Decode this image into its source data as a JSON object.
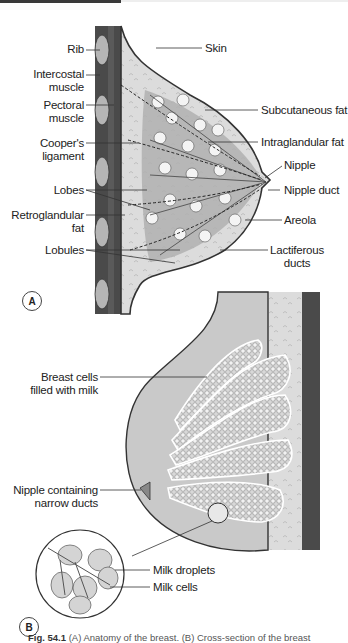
{
  "figure": {
    "panel_a": {
      "badge": "A",
      "left_labels": [
        {
          "text": "Rib",
          "lines": [
            "Rib"
          ]
        },
        {
          "text": "Intercostal muscle",
          "lines": [
            "Intercostal",
            "muscle"
          ]
        },
        {
          "text": "Pectoral muscle",
          "lines": [
            "Pectoral",
            "muscle"
          ]
        },
        {
          "text": "Cooper's ligament",
          "lines": [
            "Cooper's",
            "ligament"
          ]
        },
        {
          "text": "Lobes",
          "lines": [
            "Lobes"
          ]
        },
        {
          "text": "Retroglandular fat",
          "lines": [
            "Retroglandular",
            "fat"
          ]
        },
        {
          "text": "Lobules",
          "lines": [
            "Lobules"
          ]
        }
      ],
      "right_labels": [
        {
          "text": "Skin",
          "lines": [
            "Skin"
          ]
        },
        {
          "text": "Subcutaneous fat",
          "lines": [
            "Subcutaneous fat"
          ]
        },
        {
          "text": "Intraglandular fat",
          "lines": [
            "Intraglandular fat"
          ]
        },
        {
          "text": "Nipple",
          "lines": [
            "Nipple"
          ]
        },
        {
          "text": "Nipple duct",
          "lines": [
            "Nipple duct"
          ]
        },
        {
          "text": "Areola",
          "lines": [
            "Areola"
          ]
        },
        {
          "text": "Lactiferous ducts",
          "lines": [
            "Lactiferous",
            "ducts"
          ]
        }
      ]
    },
    "panel_b": {
      "badge": "B",
      "labels": [
        {
          "text": "Breast cells filled with milk",
          "lines": [
            "Breast cells",
            "filled with milk"
          ]
        },
        {
          "text": "Nipple containing narrow ducts",
          "lines": [
            "Nipple containing",
            "narrow ducts"
          ]
        },
        {
          "text": "Milk droplets",
          "lines": [
            "Milk droplets"
          ]
        },
        {
          "text": "Milk cells",
          "lines": [
            "Milk cells"
          ]
        }
      ]
    },
    "caption": {
      "fig_number": "Fig. 54.1",
      "text": "(A) Anatomy of the breast. (B) Cross-section of the breast"
    }
  },
  "colors": {
    "muscle": "#4a4a4a",
    "rib": "#b8b8b8",
    "fat": "#d6d6d6",
    "gland": "#a9a9a9",
    "skin_line": "#333333",
    "leader": "#333333"
  }
}
